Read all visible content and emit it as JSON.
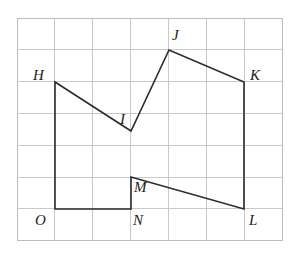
{
  "figure": {
    "canvas": {
      "width": 301,
      "height": 267,
      "background": "#ffffff"
    },
    "grid": {
      "origin_x": 17,
      "origin_y": 18,
      "cell_width": 37.9,
      "cell_height": 31.8,
      "columns": 7,
      "rows": 7,
      "line_color": "#c9c9c9",
      "border_color": "#bdbdbd",
      "line_width": 1
    },
    "shape": {
      "stroke_color": "#2b2b2b",
      "stroke_width": 1.6,
      "fill": "none",
      "closed": true,
      "path_order": [
        "H",
        "I",
        "J",
        "K",
        "L",
        "M",
        "N",
        "O"
      ]
    },
    "vertices": [
      {
        "id": "H",
        "label": "H",
        "x": 55,
        "y": 82,
        "grid_col": 1,
        "grid_row": 2,
        "label_x": 33,
        "label_y": 68
      },
      {
        "id": "I",
        "label": "I",
        "x": 131,
        "y": 131,
        "grid_col": 3,
        "grid_row": 4,
        "label_x": 120,
        "label_y": 112
      },
      {
        "id": "J",
        "label": "J",
        "x": 169,
        "y": 50,
        "grid_col": 4,
        "grid_row": 1,
        "label_x": 172,
        "label_y": 28
      },
      {
        "id": "K",
        "label": "K",
        "x": 244,
        "y": 82,
        "grid_col": 6,
        "grid_row": 2,
        "label_x": 250,
        "label_y": 68
      },
      {
        "id": "L",
        "label": "L",
        "x": 244,
        "y": 209,
        "grid_col": 6,
        "grid_row": 6,
        "label_x": 249,
        "label_y": 213
      },
      {
        "id": "M",
        "label": "M",
        "x": 131,
        "y": 177,
        "grid_col": 3,
        "grid_row": 5,
        "label_x": 134,
        "label_y": 180
      },
      {
        "id": "N",
        "label": "N",
        "x": 131,
        "y": 209,
        "grid_col": 3,
        "grid_row": 6,
        "label_x": 133,
        "label_y": 213
      },
      {
        "id": "O",
        "label": "O",
        "x": 55,
        "y": 209,
        "grid_col": 1,
        "grid_row": 6,
        "label_x": 35,
        "label_y": 213
      }
    ],
    "edges": [
      {
        "from": "H",
        "to": "I"
      },
      {
        "from": "I",
        "to": "J"
      },
      {
        "from": "J",
        "to": "K"
      },
      {
        "from": "K",
        "to": "L"
      },
      {
        "from": "L",
        "to": "M"
      },
      {
        "from": "M",
        "to": "N"
      },
      {
        "from": "N",
        "to": "O"
      },
      {
        "from": "O",
        "to": "H"
      }
    ]
  }
}
